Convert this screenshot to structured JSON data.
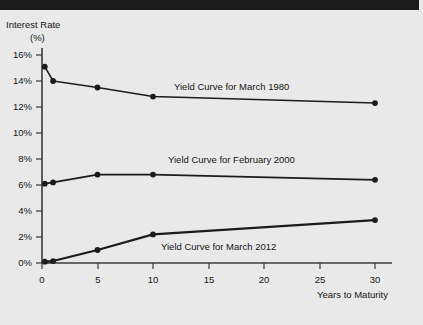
{
  "figure": {
    "background_color": "#e9e9e9",
    "top_bar_color": "#1b1b1b",
    "line_color": "#1b1b1b",
    "axis_color": "#3a3a3a"
  },
  "axes": {
    "ylabel_line1": "Interest Rate",
    "ylabel_line2": "(%)",
    "xlabel": "Years to Maturity",
    "yticks": [
      "0%",
      "2%",
      "4%",
      "6%",
      "8%",
      "10%",
      "12%",
      "14%",
      "16%"
    ],
    "xticks": [
      "0",
      "5",
      "10",
      "15",
      "20",
      "25",
      "30"
    ]
  },
  "labels": {
    "series_1980": "Yield Curve for March 1980",
    "series_2000": "Yield Curve for February 2000",
    "series_2012": "Yield Curve for March 2012"
  },
  "chart_data": {
    "type": "line",
    "title": "",
    "xlabel": "Years to Maturity",
    "ylabel": "Interest Rate (%)",
    "xlim": [
      0,
      31.5
    ],
    "ylim": [
      0,
      16.8
    ],
    "xticks": [
      0,
      5,
      10,
      15,
      20,
      25,
      30
    ],
    "yticks": [
      0,
      2,
      4,
      6,
      8,
      10,
      12,
      14,
      16
    ],
    "grid": false,
    "legend": "inline-annotations",
    "series": [
      {
        "name": "Yield Curve for March 1980",
        "x": [
          0.25,
          1,
          5,
          10,
          30
        ],
        "values": [
          15.1,
          14.0,
          13.5,
          12.8,
          12.3
        ]
      },
      {
        "name": "Yield Curve for February 2000",
        "x": [
          0.25,
          1,
          5,
          10,
          30
        ],
        "values": [
          6.1,
          6.2,
          6.8,
          6.8,
          6.4
        ]
      },
      {
        "name": "Yield Curve for March 2012",
        "x": [
          0.25,
          1,
          5,
          10,
          30
        ],
        "values": [
          0.1,
          0.15,
          1.0,
          2.2,
          3.3
        ]
      }
    ]
  }
}
